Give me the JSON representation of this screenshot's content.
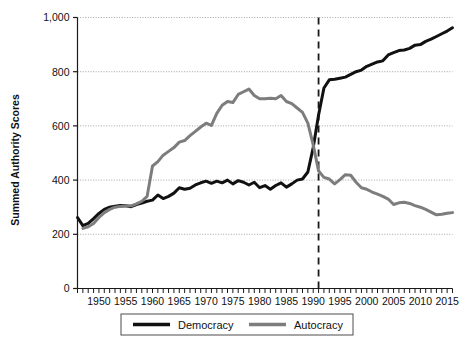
{
  "chart_data": {
    "type": "line",
    "title": "",
    "xlabel": "",
    "ylabel": "Summed Authority Scores",
    "xlim": [
      1946,
      2016
    ],
    "ylim": [
      0,
      1000
    ],
    "grid": true,
    "legend_position": "bottom-center",
    "y_ticks": [
      0,
      200,
      400,
      600,
      800,
      1000
    ],
    "y_tick_labels": [
      "0",
      "200",
      "400",
      "600",
      "800",
      "1,000"
    ],
    "x_tick_labels": [
      "1950",
      "1955",
      "1960",
      "1965",
      "1970",
      "1975",
      "1980",
      "1985",
      "1990",
      "1995",
      "2000",
      "2005",
      "2010",
      "2015"
    ],
    "x_tick_values": [
      1950,
      1955,
      1960,
      1965,
      1970,
      1975,
      1980,
      1985,
      1990,
      1995,
      2000,
      2005,
      2010,
      2015
    ],
    "x_minor_tick_step": 1,
    "annotations": [
      {
        "name": "reference-line-1991",
        "type": "vline",
        "x": 1991,
        "style": "dashed",
        "color": "#1a1a1a"
      }
    ],
    "x": [
      1946,
      1947,
      1948,
      1949,
      1950,
      1951,
      1952,
      1953,
      1954,
      1955,
      1956,
      1957,
      1958,
      1959,
      1960,
      1961,
      1962,
      1963,
      1964,
      1965,
      1966,
      1967,
      1968,
      1969,
      1970,
      1971,
      1972,
      1973,
      1974,
      1975,
      1976,
      1977,
      1978,
      1979,
      1980,
      1981,
      1982,
      1983,
      1984,
      1985,
      1986,
      1987,
      1988,
      1989,
      1990,
      1991,
      1992,
      1993,
      1994,
      1995,
      1996,
      1997,
      1998,
      1999,
      2000,
      2001,
      2002,
      2003,
      2004,
      2005,
      2006,
      2007,
      2008,
      2009,
      2010,
      2011,
      2012,
      2013,
      2014,
      2015,
      2016
    ],
    "series": [
      {
        "name": "Democracy",
        "color": "#111111",
        "linewidth": 3.0,
        "values": [
          262,
          232,
          240,
          258,
          277,
          292,
          300,
          304,
          306,
          305,
          302,
          310,
          315,
          322,
          326,
          345,
          332,
          340,
          352,
          372,
          366,
          370,
          382,
          390,
          396,
          388,
          396,
          390,
          400,
          386,
          398,
          392,
          382,
          392,
          372,
          380,
          366,
          380,
          390,
          374,
          386,
          400,
          404,
          430,
          520,
          640,
          740,
          770,
          772,
          776,
          780,
          790,
          800,
          806,
          820,
          828,
          836,
          840,
          862,
          870,
          878,
          880,
          886,
          898,
          900,
          912,
          920,
          930,
          940,
          950,
          962
        ]
      },
      {
        "name": "Autocracy",
        "color": "#7d7d7d",
        "linewidth": 3.0,
        "values": [
          null,
          222,
          228,
          240,
          262,
          280,
          292,
          300,
          303,
          304,
          305,
          312,
          322,
          340,
          452,
          468,
          492,
          506,
          520,
          540,
          546,
          564,
          580,
          596,
          610,
          602,
          646,
          676,
          690,
          686,
          716,
          726,
          736,
          712,
          700,
          700,
          702,
          700,
          712,
          690,
          682,
          666,
          650,
          610,
          530,
          434,
          410,
          404,
          386,
          402,
          420,
          418,
          392,
          372,
          366,
          356,
          348,
          340,
          330,
          310,
          316,
          318,
          314,
          306,
          300,
          292,
          282,
          272,
          274,
          278,
          280
        ]
      }
    ]
  },
  "legend": {
    "items": [
      {
        "label": "Democracy",
        "color": "#111111"
      },
      {
        "label": "Autocracy",
        "color": "#7d7d7d"
      }
    ]
  },
  "axes": {
    "y_title": "Summed Authority Scores"
  }
}
